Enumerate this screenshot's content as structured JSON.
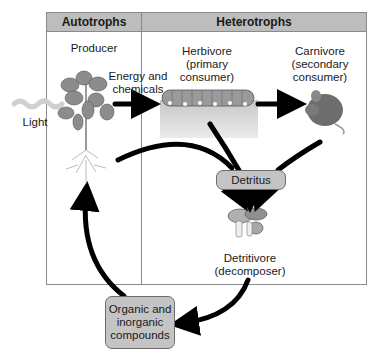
{
  "headers": {
    "autotrophs": "Autotrophs",
    "heterotrophs": "Heterotrophs"
  },
  "labels": {
    "producer": "Producer",
    "energy_line1": "Energy and",
    "energy_line2": "chemicals",
    "herbivore_line1": "Herbivore",
    "herbivore_line2": "(primary",
    "herbivore_line3": "consumer)",
    "carnivore_line1": "Carnivore",
    "carnivore_line2": "(secondary",
    "carnivore_line3": "consumer)",
    "light": "Light",
    "detritivore_line1": "Detritivore",
    "detritivore_line2": "(decomposer)"
  },
  "boxes": {
    "detritus": "Detritus",
    "compounds_line1": "Organic and",
    "compounds_line2": "inorganic",
    "compounds_line3": "compounds"
  },
  "colors": {
    "header_fill": "#bdbdbd",
    "box_fill": "#c4c4c4",
    "arrow": "#000000",
    "border": "#8a8a8a"
  }
}
